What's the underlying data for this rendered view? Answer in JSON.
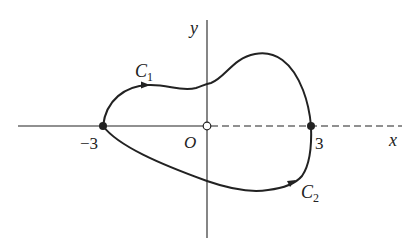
{
  "diagram": {
    "axes": {
      "x_label": "x",
      "y_label": "y",
      "origin_label": "O",
      "tick_neg": "−3",
      "tick_pos": "3",
      "positive_x_axis_style": "dashed"
    },
    "curves": [
      {
        "name": "C1",
        "label_main": "C",
        "label_sub": "1",
        "from": "-3",
        "to": "3",
        "path": "upper",
        "direction": "left-to-right"
      },
      {
        "name": "C2",
        "label_main": "C",
        "label_sub": "2",
        "from": "-3",
        "to": "3",
        "path": "lower",
        "direction": "left-to-right"
      }
    ],
    "points": [
      {
        "x": -3,
        "y": 0,
        "style": "filled"
      },
      {
        "x": 0,
        "y": 0,
        "style": "open"
      },
      {
        "x": 3,
        "y": 0,
        "style": "filled"
      }
    ],
    "colors": {
      "ink": "#222222",
      "background": "#ffffff"
    }
  }
}
